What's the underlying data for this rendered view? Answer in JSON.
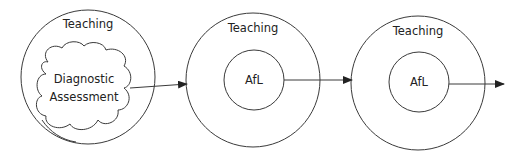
{
  "diagram": {
    "stages": [
      {
        "outer_label": "Teaching",
        "inner_label_line1": "Diagnostic",
        "inner_label_line2": "Assessment",
        "inner_shape": "cloud"
      },
      {
        "outer_label": "Teaching",
        "inner_label": "AfL",
        "inner_shape": "circle"
      },
      {
        "outer_label": "Teaching",
        "inner_label": "AfL",
        "inner_shape": "circle"
      }
    ],
    "colors": {
      "stroke": "#3a3a3a",
      "text": "#222222",
      "background": "#ffffff"
    }
  }
}
